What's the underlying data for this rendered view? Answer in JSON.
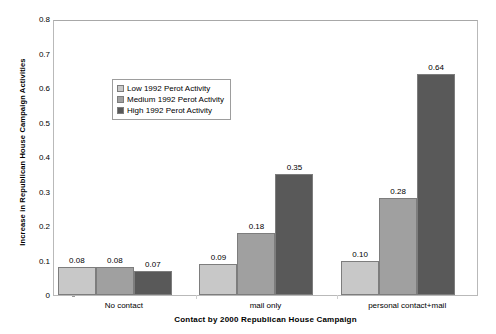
{
  "chart_data": {
    "type": "bar",
    "title": "",
    "xlabel": "Contact by 2000 Republican House Campaign",
    "ylabel": "Increase in Republican House Campaign Activities",
    "categories": [
      "No contact",
      "mail only",
      "personal contact+mail"
    ],
    "series": [
      {
        "name": "Low 1992 Perot Activity",
        "color": "#c8c8c8",
        "values": [
          0.08,
          0.09,
          0.1
        ],
        "labels": [
          "0.08",
          "0.09",
          "0.10"
        ]
      },
      {
        "name": "Medium 1992 Perot Activity",
        "color": "#a0a0a0",
        "values": [
          0.08,
          0.18,
          0.28
        ],
        "labels": [
          "0.08",
          "0.18",
          "0.28"
        ]
      },
      {
        "name": "High 1992 Perot Activity",
        "color": "#595959",
        "values": [
          0.07,
          0.35,
          0.64
        ],
        "labels": [
          "0.07",
          "0.35",
          "0.64"
        ]
      }
    ],
    "ylim": [
      0,
      0.8
    ],
    "ytick_labels": [
      "0.8",
      "0.7",
      "0.6",
      "0.5",
      "0.4",
      "0.3",
      "0.2",
      "0.1",
      "0"
    ],
    "ytick_values": [
      0.8,
      0.7,
      0.6,
      0.5,
      0.4,
      0.3,
      0.2,
      0.1,
      0
    ],
    "grid": false,
    "legend_position": "upper-left-inside",
    "bar_border_color": "#7d7d7d",
    "plot_border_color": "#b9b9b9"
  }
}
